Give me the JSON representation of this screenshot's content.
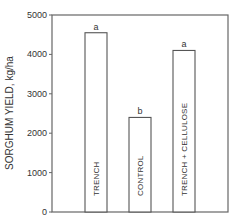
{
  "chart_data": {
    "type": "bar",
    "title": "",
    "xlabel": "",
    "ylabel": "SORGHUM YIELD, kg/ha",
    "ylim": [
      0,
      5000
    ],
    "yticks": [
      0,
      1000,
      2000,
      3000,
      4000,
      5000
    ],
    "grid": false,
    "legend": "none",
    "categories": [
      "TRENCH",
      "CONTROL",
      "TRENCH + CELLULOSE"
    ],
    "values": [
      4550,
      2400,
      4100
    ],
    "significance_letters": [
      "a",
      "b",
      "a"
    ],
    "bar_fill": "#ffffff",
    "bar_stroke": "#555555"
  }
}
